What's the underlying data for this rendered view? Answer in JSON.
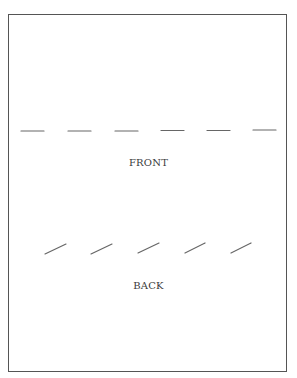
{
  "diagram": {
    "front": {
      "label": "FRONT",
      "dash_count": 6,
      "dash_style": "horizontal"
    },
    "back": {
      "label": "BACK",
      "dash_count": 5,
      "dash_style": "slanted"
    },
    "colors": {
      "border": "#555555",
      "dash": "#666666",
      "text": "#3a3a3a"
    }
  }
}
